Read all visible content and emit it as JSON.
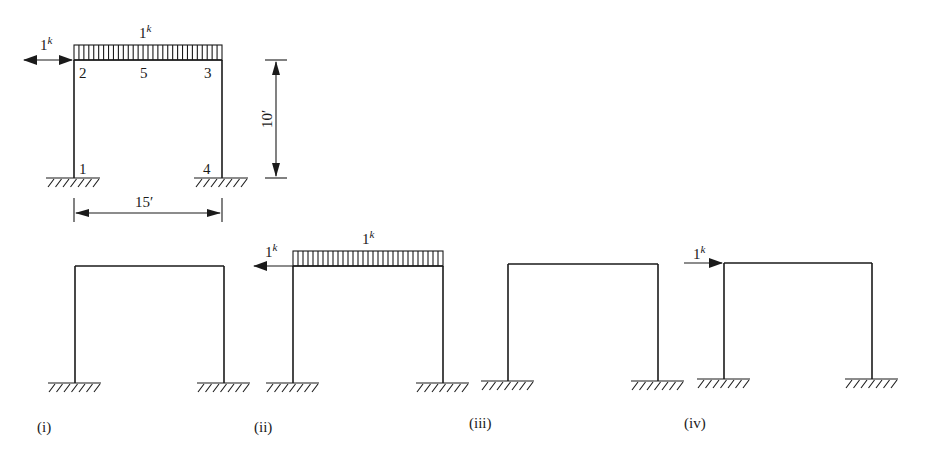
{
  "figure": {
    "main_frame": {
      "nodes": [
        {
          "id": "1",
          "label": "1"
        },
        {
          "id": "2",
          "label": "2"
        },
        {
          "id": "3",
          "label": "3"
        },
        {
          "id": "4",
          "label": "4"
        },
        {
          "id": "5",
          "label": "5"
        }
      ],
      "distributed_load": {
        "value": "1",
        "unit": "k"
      },
      "horizontal_load": {
        "value": "1",
        "unit": "k",
        "direction": "both"
      },
      "dimensions": {
        "height": "10′",
        "span": "15′"
      }
    },
    "cases": [
      {
        "caption": "(i)",
        "loads": []
      },
      {
        "caption": "(ii)",
        "loads": [
          {
            "type": "distributed",
            "value": "1",
            "unit": "k"
          },
          {
            "type": "horizontal-left",
            "value": "1",
            "unit": "k"
          }
        ]
      },
      {
        "caption": "(iii)",
        "loads": []
      },
      {
        "caption": "(iv)",
        "loads": [
          {
            "type": "horizontal-right",
            "value": "1",
            "unit": "k"
          }
        ]
      }
    ]
  },
  "colors": {
    "ink": "#1a1a1a",
    "background": "#ffffff"
  }
}
